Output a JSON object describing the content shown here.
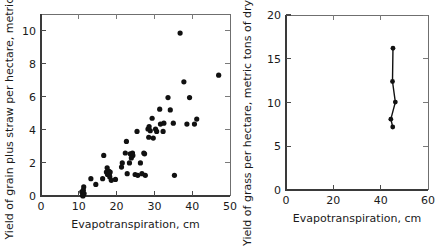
{
  "figure": {
    "background": "#ffffff",
    "point_color": "#111111",
    "axis_color": "#3a3a3a"
  },
  "chart_data": [
    {
      "id": "left",
      "type": "scatter",
      "title": "",
      "xlabel": "Evapotranspiration, cm",
      "ylabel": "Yield of grain plus straw per hectare, metric tons",
      "xlim": [
        0,
        50
      ],
      "ylim": [
        0,
        11
      ],
      "xticks": [
        0,
        10,
        20,
        30,
        40,
        50
      ],
      "yticks": [
        0,
        2,
        4,
        6,
        8,
        10
      ],
      "xticklabels": [
        "0",
        "10",
        "20",
        "30",
        "40",
        "50"
      ],
      "yticklabels": [
        "0",
        "2",
        "4",
        "6",
        "8",
        "10"
      ],
      "grid": false,
      "legend": "none",
      "points": [
        [
          10.8,
          0.25
        ],
        [
          11.0,
          0.05
        ],
        [
          11.2,
          0.35
        ],
        [
          11.4,
          0.15
        ],
        [
          11.3,
          0.55
        ],
        [
          11.1,
          0.0
        ],
        [
          13.2,
          1.05
        ],
        [
          14.5,
          0.7
        ],
        [
          16.3,
          1.05
        ],
        [
          16.6,
          2.45
        ],
        [
          17.3,
          1.45
        ],
        [
          17.5,
          1.7
        ],
        [
          17.6,
          1.3
        ],
        [
          17.9,
          1.5
        ],
        [
          18.1,
          1.35
        ],
        [
          18.3,
          1.45
        ],
        [
          18.2,
          1.15
        ],
        [
          18.6,
          0.95
        ],
        [
          19.7,
          1.0
        ],
        [
          21.3,
          1.75
        ],
        [
          21.5,
          2.0
        ],
        [
          22.3,
          2.6
        ],
        [
          22.6,
          3.3
        ],
        [
          22.8,
          1.35
        ],
        [
          23.4,
          2.0
        ],
        [
          23.6,
          2.55
        ],
        [
          23.9,
          2.3
        ],
        [
          24.2,
          2.6
        ],
        [
          24.3,
          2.45
        ],
        [
          24.9,
          1.3
        ],
        [
          25.4,
          3.9
        ],
        [
          25.6,
          1.25
        ],
        [
          26.3,
          2.0
        ],
        [
          26.7,
          1.35
        ],
        [
          27.2,
          2.6
        ],
        [
          27.4,
          2.55
        ],
        [
          27.6,
          1.25
        ],
        [
          28.3,
          4.05
        ],
        [
          28.5,
          3.55
        ],
        [
          28.6,
          4.2
        ],
        [
          28.9,
          3.95
        ],
        [
          29.4,
          4.7
        ],
        [
          29.7,
          3.5
        ],
        [
          30.3,
          4.05
        ],
        [
          30.6,
          3.9
        ],
        [
          31.4,
          5.25
        ],
        [
          31.6,
          4.35
        ],
        [
          32.3,
          3.9
        ],
        [
          32.5,
          4.4
        ],
        [
          33.6,
          5.95
        ],
        [
          34.2,
          5.2
        ],
        [
          35.0,
          4.4
        ],
        [
          35.3,
          1.25
        ],
        [
          36.8,
          9.85
        ],
        [
          37.8,
          6.9
        ],
        [
          38.6,
          4.35
        ],
        [
          39.3,
          5.95
        ],
        [
          40.6,
          4.35
        ],
        [
          41.2,
          4.65
        ],
        [
          47.0,
          7.3
        ]
      ]
    },
    {
      "id": "right",
      "type": "line",
      "title": "",
      "xlabel": "Evapotranspiration, cm",
      "ylabel": "Yield of grass per hectare, metric tons of dry matter",
      "xlim": [
        0,
        60
      ],
      "ylim": [
        0,
        20
      ],
      "xticks": [
        0,
        20,
        40,
        60
      ],
      "yticks": [
        0,
        5,
        10,
        15,
        20
      ],
      "xticklabels": [
        "0",
        "20",
        "40",
        "60"
      ],
      "yticklabels": [
        "0",
        "5",
        "10",
        "15",
        "20"
      ],
      "grid": false,
      "legend": "none",
      "points": [
        [
          45.2,
          16.2
        ],
        [
          45.0,
          12.4
        ],
        [
          46.2,
          10.05
        ],
        [
          44.3,
          8.1
        ],
        [
          45.1,
          7.2
        ]
      ]
    }
  ]
}
